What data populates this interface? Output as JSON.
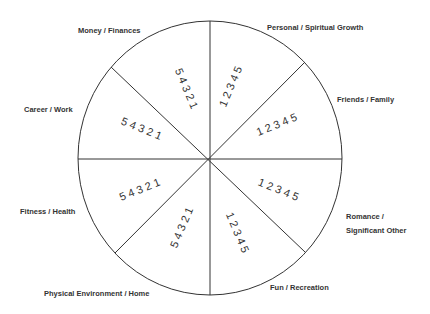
{
  "diagram": {
    "type": "wheel",
    "segments": [
      {
        "label": "Personal / Spiritual Growth",
        "scale": "1 2 3 4 5"
      },
      {
        "label": "Friends / Family",
        "scale": "1 2 3 4 5"
      },
      {
        "label": "Romance /",
        "label2": "Significant Other",
        "scale": "1 2 3 4 5"
      },
      {
        "label": "Fun / Recreation",
        "scale": "1 2 3 4 5"
      },
      {
        "label": "Physical Environment / Home",
        "scale": "5 4 3 2 1"
      },
      {
        "label": "Fitness / Health",
        "scale": "5 4 3 2 1"
      },
      {
        "label": "Career / Work",
        "scale": "5 4 3 2 1"
      },
      {
        "label": "Money / Finances",
        "scale": "5 4 3 2 1"
      }
    ],
    "line_color": "#333333",
    "background": "#ffffff"
  }
}
